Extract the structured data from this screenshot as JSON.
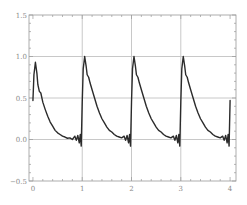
{
  "chart_data": {
    "type": "line",
    "title": "",
    "xlabel": "",
    "ylabel": "",
    "xlim": [
      -0.08,
      4.12
    ],
    "ylim": [
      -0.5,
      1.5
    ],
    "xticks": [
      0,
      1,
      2,
      3,
      4
    ],
    "xtick_labels": [
      "0",
      "1",
      "2",
      "3",
      "4"
    ],
    "yticks": [
      -0.5,
      0.0,
      0.5,
      1.0,
      1.5
    ],
    "ytick_labels": [
      "−0.5",
      "0.0",
      "0.5",
      "1.0",
      "1.5"
    ],
    "grid": true,
    "gridlines_x": [
      1,
      2,
      3
    ],
    "gridlines_y": [
      0.0,
      0.5,
      1.0
    ],
    "legend": null,
    "line_color": "#2b2b2b",
    "grid_color": "#c8c8c8",
    "frame_color": "#9a9a9a",
    "series": [
      {
        "name": "periodic decaying pulse (Fourier approximation)",
        "period": 1,
        "x": [
          0.0,
          0.02,
          0.05,
          0.08,
          0.1,
          0.13,
          0.16,
          0.2,
          0.25,
          0.3,
          0.35,
          0.4,
          0.45,
          0.5,
          0.55,
          0.6,
          0.65,
          0.7,
          0.75,
          0.8,
          0.85,
          0.88,
          0.91,
          0.94,
          0.96,
          0.98,
          1.0,
          1.02,
          1.05,
          1.08,
          1.1,
          1.13,
          1.16,
          1.2,
          1.25,
          1.3,
          1.35,
          1.4,
          1.45,
          1.5,
          1.55,
          1.6,
          1.65,
          1.7,
          1.75,
          1.8,
          1.85,
          1.88,
          1.91,
          1.94,
          1.96,
          1.98,
          2.0,
          2.02,
          2.05,
          2.08,
          2.1,
          2.13,
          2.16,
          2.2,
          2.25,
          2.3,
          2.35,
          2.4,
          2.45,
          2.5,
          2.55,
          2.6,
          2.65,
          2.7,
          2.75,
          2.8,
          2.85,
          2.88,
          2.91,
          2.94,
          2.96,
          2.98,
          3.0,
          3.02,
          3.05,
          3.08,
          3.1,
          3.13,
          3.16,
          3.2,
          3.25,
          3.3,
          3.35,
          3.4,
          3.45,
          3.5,
          3.55,
          3.6,
          3.65,
          3.7,
          3.75,
          3.8,
          3.85,
          3.88,
          3.91,
          3.94,
          3.96,
          3.98,
          4.0
        ],
        "y": [
          0.47,
          0.78,
          0.93,
          0.8,
          0.66,
          0.58,
          0.56,
          0.45,
          0.36,
          0.28,
          0.21,
          0.16,
          0.11,
          0.08,
          0.06,
          0.04,
          0.03,
          0.015,
          0.02,
          0.0,
          0.04,
          -0.01,
          0.05,
          -0.04,
          0.06,
          -0.08,
          0.45,
          0.85,
          1.0,
          0.88,
          0.78,
          0.75,
          0.68,
          0.6,
          0.5,
          0.4,
          0.32,
          0.25,
          0.2,
          0.15,
          0.11,
          0.09,
          0.06,
          0.04,
          0.03,
          0.02,
          0.04,
          -0.01,
          0.05,
          -0.04,
          0.06,
          -0.08,
          0.45,
          0.85,
          1.0,
          0.88,
          0.78,
          0.75,
          0.68,
          0.6,
          0.5,
          0.4,
          0.32,
          0.25,
          0.2,
          0.15,
          0.11,
          0.09,
          0.06,
          0.04,
          0.03,
          0.02,
          0.04,
          -0.01,
          0.05,
          -0.04,
          0.06,
          -0.08,
          0.45,
          0.85,
          1.0,
          0.88,
          0.78,
          0.75,
          0.68,
          0.6,
          0.5,
          0.4,
          0.32,
          0.25,
          0.2,
          0.15,
          0.11,
          0.09,
          0.06,
          0.04,
          0.03,
          0.02,
          0.04,
          -0.01,
          0.05,
          -0.04,
          0.06,
          -0.08,
          0.47
        ]
      }
    ],
    "annotations": [
      {
        "description": "first peak",
        "x": 0.05,
        "y": 0.93
      },
      {
        "description": "peaks after each integer",
        "x": [
          1.05,
          2.05,
          3.05
        ],
        "y": 1.0
      },
      {
        "description": "Gibbs-type ripples just before each jump",
        "min_y": -0.08
      }
    ]
  }
}
